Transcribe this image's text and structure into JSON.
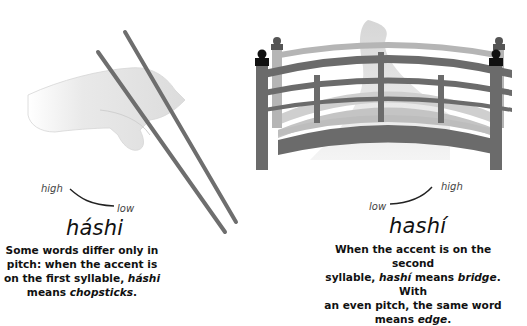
{
  "left": {
    "illustration": "hand-holding-chopsticks",
    "pitch_high": "high",
    "pitch_low": "low",
    "word": "háshi",
    "desc_line1": "Some words differ only in",
    "desc_line2": "pitch: when the accent is",
    "desc_line3_pre": "on the first syllable, ",
    "desc_line3_em": "háshi",
    "desc_line4_pre": "means ",
    "desc_line4_em": "chopsticks",
    "desc_line4_post": "."
  },
  "right": {
    "illustration": "arched-japanese-bridge",
    "pitch_low": "low",
    "pitch_high": "high",
    "word": "hashí",
    "desc_line1": "When the accent is on the second",
    "desc_line2_pre": "syllable, ",
    "desc_line2_em1": "hashí",
    "desc_line2_mid": " means ",
    "desc_line2_em2": "bridge",
    "desc_line2_post": ". With",
    "desc_line3": "an even pitch, the same word",
    "desc_line4_pre": "means ",
    "desc_line4_em": "edge",
    "desc_line4_post": "."
  },
  "colors": {
    "chopstick": "#6e6e6e",
    "bridge_dark": "#6b6b6b",
    "bridge_light": "#b5b5b5",
    "hand": "#e6e6e6"
  }
}
